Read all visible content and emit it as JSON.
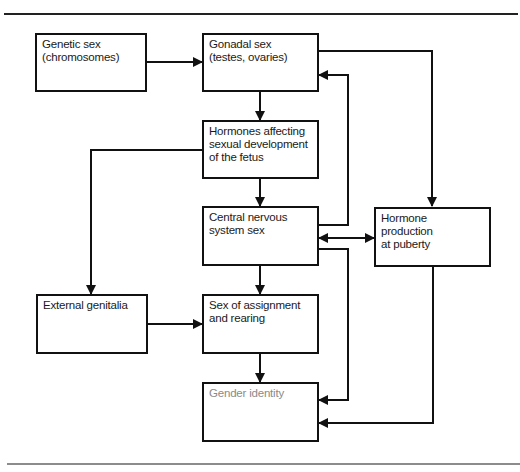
{
  "diagram": {
    "type": "flowchart",
    "colors": {
      "line": "#111111",
      "rule": "#555555",
      "muted_text": "#8a8a8a"
    },
    "nodes": [
      {
        "id": "genetic",
        "label": "Genetic sex\n(chromosomes)"
      },
      {
        "id": "gonadal",
        "label": "Gonadal sex\n(testes, ovaries)"
      },
      {
        "id": "fetal_hormones",
        "label": "Hormones affecting\nsexual development\nof the fetus"
      },
      {
        "id": "cns",
        "label": "Central nervous\nsystem sex"
      },
      {
        "id": "puberty",
        "label": "Hormone\nproduction\nat puberty"
      },
      {
        "id": "genitalia",
        "label": "External genitalia"
      },
      {
        "id": "assignment",
        "label": "Sex of assignment\nand rearing"
      },
      {
        "id": "gender",
        "label": "Gender identity"
      }
    ],
    "edges": [
      {
        "from": "genetic",
        "to": "gonadal"
      },
      {
        "from": "gonadal",
        "to": "fetal_hormones"
      },
      {
        "from": "gonadal",
        "to": "puberty"
      },
      {
        "from": "fetal_hormones",
        "to": "cns"
      },
      {
        "from": "fetal_hormones",
        "to": "genitalia"
      },
      {
        "from": "cns",
        "to": "gonadal"
      },
      {
        "from": "cns",
        "to": "puberty",
        "bidirectional": true
      },
      {
        "from": "cns",
        "to": "assignment"
      },
      {
        "from": "cns",
        "to": "gender"
      },
      {
        "from": "genitalia",
        "to": "assignment"
      },
      {
        "from": "assignment",
        "to": "gender"
      },
      {
        "from": "puberty",
        "to": "gender"
      }
    ]
  }
}
